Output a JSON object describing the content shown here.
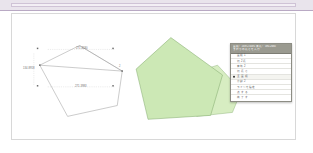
{
  "window": {
    "background_color": "#ffffff",
    "band_color": "#e9e4ec",
    "band_border_color": "#b9a9c4"
  },
  "canvas": {
    "background_color": "#ffffff",
    "border_color": "#d8d8d8"
  },
  "left_shape": {
    "name": "selected-polygon",
    "stroke_color": "#8a8a8a",
    "fill_color": "none",
    "handle_color": "#6a6a6a",
    "dimensions": [
      {
        "id": "top",
        "value": "271.4180",
        "orientation": "horizontal"
      },
      {
        "id": "middle",
        "value": "271.3983",
        "orientation": "horizontal"
      },
      {
        "id": "left",
        "value": "134.8918",
        "orientation": "vertical"
      }
    ],
    "vertex_tags": [
      {
        "id": "right-vertex",
        "value": "2"
      }
    ]
  },
  "right_shape": {
    "name": "parcel-polygon",
    "fill_color": "#cce8b5",
    "stroke_color": "#7fa86a",
    "secondary_fill_color": "#d7edc2"
  },
  "context_menu": {
    "header_lines": [
      "面積：16972.6491  周長：590.2680",
      "まわりの長さを入力"
    ],
    "header_bg_color": "#9a9a90",
    "header_text_color": "#ffffff",
    "border_color": "#8d8d84",
    "items": [
      {
        "label": "面積 1",
        "selected": false
      },
      {
        "label": "辺 2 長",
        "selected": false
      },
      {
        "label": "有効 2",
        "selected": false
      },
      {
        "label": "辺 長 さ",
        "selected": false
      },
      {
        "label": "全 面 積",
        "selected": true
      },
      {
        "label": "分割 2",
        "selected": false
      },
      {
        "label": "ラインを指定",
        "selected": false
      },
      {
        "label": "点 す る",
        "selected": false
      },
      {
        "label": "終 了 す",
        "selected": false
      }
    ]
  }
}
